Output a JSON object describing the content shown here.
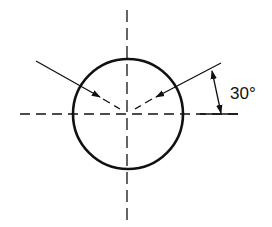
{
  "diagram": {
    "title": "",
    "angle_label": "30°",
    "angle_degrees": 30,
    "elements": [
      {
        "type": "circle",
        "name": "hole-outline"
      },
      {
        "type": "centerline",
        "orientation": "horizontal"
      },
      {
        "type": "centerline",
        "orientation": "vertical"
      },
      {
        "type": "leader-arrow",
        "side": "left"
      },
      {
        "type": "leader-arrow",
        "side": "right"
      },
      {
        "type": "angular-dimension",
        "value": "30°"
      }
    ],
    "colors": {
      "stroke": "#111111",
      "background": "#ffffff"
    }
  }
}
